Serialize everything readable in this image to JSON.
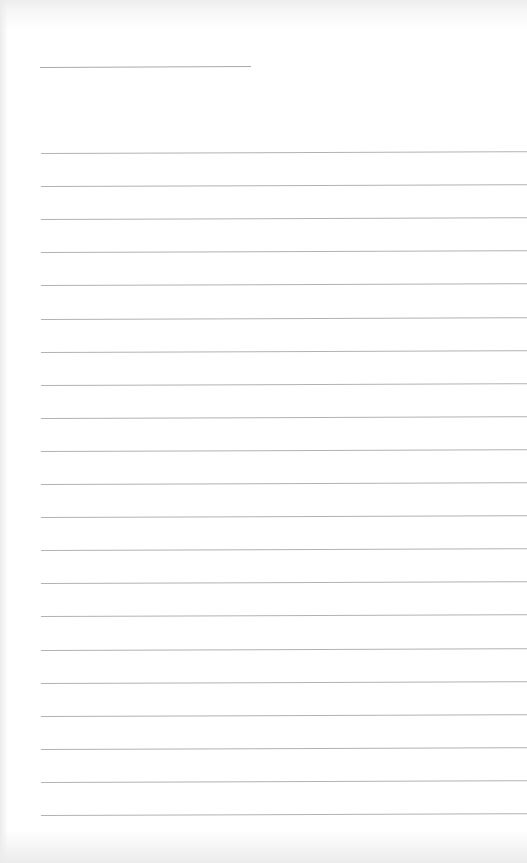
{
  "page": {
    "type": "lined-paper",
    "background": "#ffffff",
    "line_color": "#b2b2b2",
    "title_line": {
      "x": 40,
      "y": 67,
      "width": 211
    },
    "rules": {
      "count": 21,
      "start_y": 153,
      "spacing": 33.1,
      "x": 41
    },
    "text": []
  }
}
